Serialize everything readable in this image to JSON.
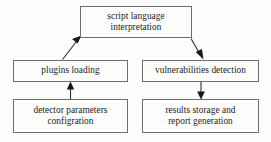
{
  "diagram": {
    "type": "flowchart",
    "canvas": {
      "width": 271,
      "height": 142,
      "background": "#fdfdfb"
    },
    "style": {
      "box_border_color": "#6e6e6e",
      "box_fill_color": "#fdfdfb",
      "text_color": "#1a1a1a",
      "arrow_color": "#2b2b2b"
    },
    "nodes": [
      {
        "id": "script",
        "label": "script language\ninterpretation",
        "x": 80,
        "y": 6,
        "width": 112,
        "height": 32
      },
      {
        "id": "plugins",
        "label": "plugins loading",
        "x": 13,
        "y": 60,
        "width": 115,
        "height": 22
      },
      {
        "id": "vulnerabilities",
        "label": "vulnerabilities detection",
        "x": 142,
        "y": 60,
        "width": 117,
        "height": 22
      },
      {
        "id": "detector",
        "label": "detector parameters\nconfigration",
        "x": 13,
        "y": 99,
        "width": 115,
        "height": 34
      },
      {
        "id": "results",
        "label": "results storage and\nreport generation",
        "x": 142,
        "y": 99,
        "width": 117,
        "height": 34
      }
    ],
    "edges": [
      {
        "id": "plugins-to-script",
        "from": "plugins",
        "to": "script",
        "kind": "diagonal",
        "direction": "up-right",
        "arrowhead_at": "script"
      },
      {
        "id": "script-to-vulnerabilities",
        "from": "script",
        "to": "vulnerabilities",
        "kind": "diagonal",
        "direction": "down-right",
        "arrowhead_at": "vulnerabilities"
      },
      {
        "id": "detector-to-plugins",
        "from": "detector",
        "to": "plugins",
        "kind": "vertical",
        "direction": "up",
        "arrowhead_at": "plugins"
      },
      {
        "id": "vulnerabilities-to-results",
        "from": "vulnerabilities",
        "to": "results",
        "kind": "vertical",
        "direction": "down",
        "arrowhead_at": "results"
      }
    ]
  }
}
